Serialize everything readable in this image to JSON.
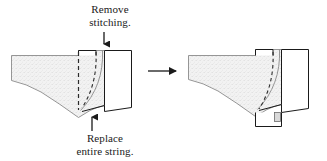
{
  "figure": {
    "type": "instructional-diagram",
    "background_color": "#ffffff",
    "line_color": "#1a1a1a",
    "fabric_fill": "#efefef",
    "notch_fill": "#d9d9d9"
  },
  "annotations": {
    "remove": {
      "text": "Remove\nstitching.",
      "line1": "Remove",
      "line2": "stitching.",
      "pointer": "arrow-down"
    },
    "replace": {
      "text": "Replace\nentire string.",
      "line1": "Replace",
      "line2": "entire string.",
      "pointer": "arrow-up"
    }
  },
  "transition": {
    "icon": "arrow-right",
    "label": ""
  },
  "panels": [
    {
      "name": "before",
      "description": "Fabric panel with open flap and dashed stitching lines"
    },
    {
      "name": "after",
      "description": "Fabric panel with flap repositioned and lower extension"
    }
  ]
}
